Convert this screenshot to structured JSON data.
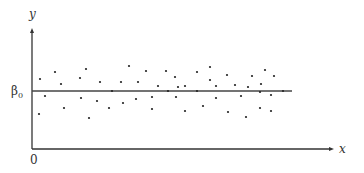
{
  "chart_data": {
    "type": "scatter",
    "title": "",
    "xlabel": "x",
    "ylabel": "y",
    "origin_label": "0",
    "reference_line": {
      "label": "β0",
      "label_main": "β",
      "label_sub": "0",
      "description": "horizontal line at y = β0"
    },
    "grid": false,
    "legend": null,
    "axis_ticks": {
      "x": [
        "0"
      ],
      "y": [
        "β0"
      ]
    },
    "note": "Points scattered randomly around the horizontal line y = β0 with constant variance; coordinates given in pixel space (x to the right, y offset from β0 line, positive = above).",
    "points_px": [
      [
        40,
        79
      ],
      [
        39,
        114
      ],
      [
        45,
        96
      ],
      [
        55,
        72
      ],
      [
        61,
        84
      ],
      [
        64,
        108
      ],
      [
        80,
        78
      ],
      [
        81,
        98
      ],
      [
        86,
        69
      ],
      [
        89,
        118
      ],
      [
        97,
        101
      ],
      [
        100,
        82
      ],
      [
        109,
        108
      ],
      [
        112,
        91
      ],
      [
        121,
        82
      ],
      [
        123,
        103
      ],
      [
        129,
        66
      ],
      [
        136,
        99
      ],
      [
        138,
        82
      ],
      [
        146,
        71
      ],
      [
        152,
        109
      ],
      [
        152,
        97
      ],
      [
        158,
        86
      ],
      [
        166,
        71
      ],
      [
        168,
        91
      ],
      [
        175,
        77
      ],
      [
        176,
        97
      ],
      [
        178,
        87
      ],
      [
        185,
        86
      ],
      [
        185,
        111
      ],
      [
        197,
        72
      ],
      [
        197,
        91
      ],
      [
        203,
        106
      ],
      [
        210,
        67
      ],
      [
        210,
        80
      ],
      [
        216,
        98
      ],
      [
        216,
        86
      ],
      [
        227,
        75
      ],
      [
        228,
        112
      ],
      [
        235,
        85
      ],
      [
        241,
        96
      ],
      [
        246,
        117
      ],
      [
        248,
        87
      ],
      [
        252,
        76
      ],
      [
        260,
        108
      ],
      [
        260,
        92
      ],
      [
        261,
        84
      ],
      [
        265,
        70
      ],
      [
        271,
        95
      ],
      [
        274,
        76
      ],
      [
        271,
        111
      ],
      [
        283,
        91
      ]
    ],
    "layout_px": {
      "origin": [
        32,
        149
      ],
      "y_axis_top": 28,
      "x_axis_right": 334,
      "beta_line_y": 91,
      "beta_line_x_end": 292
    }
  },
  "colors": {
    "axis": "#333333",
    "point": "#222222",
    "line": "#444444"
  }
}
